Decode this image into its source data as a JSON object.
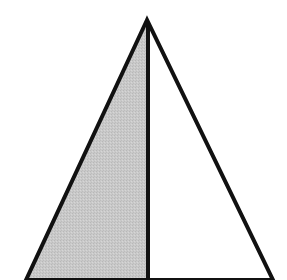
{
  "diagram": {
    "type": "triangle-with-altitude",
    "apex": [
      147,
      20
    ],
    "base_left": [
      26,
      280
    ],
    "base_right": [
      273,
      280
    ],
    "altitude_x": 148,
    "shaded_half": "left",
    "colors": {
      "background": "#ffffff",
      "stroke": "#111111",
      "shade": "#c8c8c8"
    },
    "stroke_width": 4
  }
}
